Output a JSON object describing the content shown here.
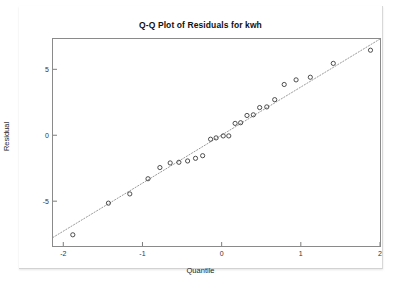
{
  "chart_data": {
    "type": "scatter",
    "title": "Q-Q Plot of Residuals for kwh",
    "xlabel": "Quantile",
    "ylabel": "Residual",
    "xlim": [
      -2.13,
      2.0
    ],
    "ylim": [
      -8.4,
      7.3
    ],
    "grid": false,
    "legend": null,
    "xticks": [
      -2,
      -1,
      0,
      1,
      2
    ],
    "xtick_labels": [
      "-2",
      "-1",
      "0",
      "1",
      "2"
    ],
    "yticks": [
      5,
      0,
      -5
    ],
    "ytick_labels": [
      "5",
      "0",
      "-5"
    ],
    "marker": "open-circle",
    "marker_color": "#3b3b3b",
    "reference_line": {
      "style": "dotted",
      "color": "#9a9a9a",
      "x": [
        -2.13,
        2.0
      ],
      "y": [
        -7.75,
        7.3
      ]
    },
    "series": [
      {
        "name": "Residuals",
        "x": [
          -1.88,
          -1.43,
          -1.16,
          -0.93,
          -0.78,
          -0.65,
          -0.54,
          -0.43,
          -0.33,
          -0.24,
          -0.14,
          -0.07,
          0.02,
          0.09,
          0.17,
          0.24,
          0.32,
          0.4,
          0.48,
          0.57,
          0.67,
          0.79,
          0.94,
          1.12,
          1.41,
          1.88
        ],
        "y": [
          -7.55,
          -5.15,
          -4.45,
          -3.3,
          -2.45,
          -2.1,
          -2.05,
          -1.95,
          -1.75,
          -1.55,
          -0.3,
          -0.2,
          -0.05,
          -0.05,
          0.9,
          0.95,
          1.5,
          1.55,
          2.1,
          2.15,
          2.7,
          3.85,
          4.2,
          4.4,
          5.45,
          6.45
        ]
      }
    ]
  },
  "axes": {
    "x_ticks": [
      {
        "label": "-2",
        "value": -2
      },
      {
        "label": "-1",
        "value": -1
      },
      {
        "label": "0",
        "value": 0
      },
      {
        "label": "1",
        "value": 1
      },
      {
        "label": "2",
        "value": 2
      }
    ],
    "y_ticks": [
      {
        "label": "5",
        "value": 5
      },
      {
        "label": "0",
        "value": 0
      },
      {
        "label": "-5",
        "value": -5
      }
    ]
  }
}
